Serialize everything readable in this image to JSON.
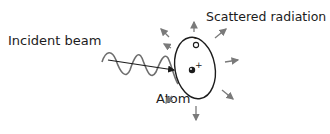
{
  "labels": {
    "incident": "Incident beam",
    "scattered": "Scattered radiation",
    "atom": "Atom",
    "electron_sign": "-",
    "nucleus_sign": "+"
  },
  "colors": {
    "ink": "#1c1c1c",
    "wave": "#6e6e6e",
    "scatter_arrows": "#7a7a7a"
  },
  "scatter_arrow_count": 8
}
